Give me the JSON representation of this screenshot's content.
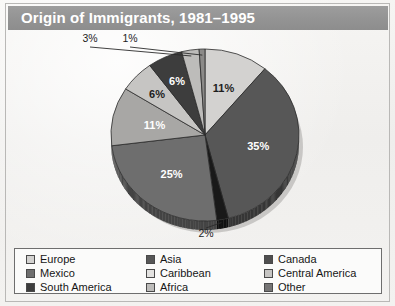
{
  "title": "Origin of Immigrants, 1981–1995",
  "chart_data": {
    "type": "pie",
    "title": "Origin of Immigrants, 1981–1995",
    "xlabel": "",
    "ylabel": "",
    "legend_position": "bottom",
    "grid": false,
    "categories": [
      "Europe",
      "Asia",
      "Canada",
      "Mexico",
      "Caribbean",
      "Central America",
      "South America",
      "Africa",
      "Other"
    ],
    "values": [
      11,
      35,
      2,
      25,
      11,
      6,
      6,
      3,
      1
    ],
    "value_labels": [
      "11%",
      "35%",
      "2%",
      "25%",
      "11%",
      "6%",
      "6%",
      "3%",
      "1%"
    ],
    "colors": [
      "#d3d2d0",
      "#575757",
      "#191919",
      "#6e6e6e",
      "#a8a7a5",
      "#c6c5c3",
      "#3d3d3d",
      "#bdbcba",
      "#8b8a88"
    ],
    "label_text_colors": [
      "#1d1d1d",
      "#ffffff",
      "#1d1d1d",
      "#ffffff",
      "#ffffff",
      "#1d1d1d",
      "#ffffff",
      "#1d1d1d",
      "#1d1d1d"
    ],
    "callouts": [
      "Canada",
      "Africa",
      "Other"
    ],
    "start_angle_deg": 0,
    "direction": "clockwise"
  },
  "slice_labels": {
    "europe": "11%",
    "asia": "35%",
    "canada": "2%",
    "mexico": "25%",
    "caribbean": "11%",
    "central_america": "6%",
    "south_america": "6%",
    "africa": "3%",
    "other": "1%"
  },
  "legend": {
    "columns": [
      {
        "items": [
          {
            "label": "Europe",
            "color": "#d3d2d0"
          },
          {
            "label": "Mexico",
            "color": "#6e6e6e"
          },
          {
            "label": "South America",
            "color": "#3d3d3d"
          }
        ]
      },
      {
        "items": [
          {
            "label": "Asia",
            "color": "#575757"
          },
          {
            "label": "Caribbean",
            "color": "#e3e2e0"
          },
          {
            "label": "Africa",
            "color": "#bdbcba"
          }
        ]
      },
      {
        "items": [
          {
            "label": "Canada",
            "color": "#4f4f4f"
          },
          {
            "label": "Central America",
            "color": "#c6c5c3"
          },
          {
            "label": "Other",
            "color": "#767575"
          }
        ]
      }
    ]
  }
}
